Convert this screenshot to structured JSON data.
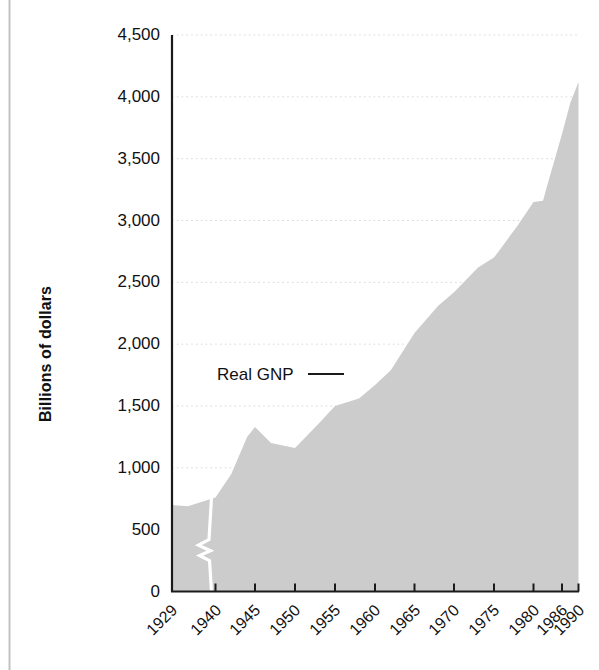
{
  "figure": {
    "background_color": "#ffffff",
    "area_fill_color": "#cccccc",
    "axis_color": "#1a1a1a",
    "gridline_color": "#d8d8d8",
    "break_marker_color": "#ffffff",
    "y_axis_title": "Billions of dollars",
    "series_annotation": "Real GNP"
  },
  "chart_data": {
    "type": "area",
    "title": "",
    "xlabel": "",
    "ylabel": "Billions of dollars",
    "series_name": "Real GNP",
    "grid": true,
    "legend_position": "inline-annotation",
    "ylim": [
      0,
      4500
    ],
    "ytick_labels": [
      "0",
      "500",
      "1,000",
      "1,500",
      "2,000",
      "2,500",
      "3,000",
      "3,500",
      "4,000",
      "4,500"
    ],
    "ytick_values": [
      0,
      500,
      1000,
      1500,
      2000,
      2500,
      3000,
      3500,
      4000,
      4500
    ],
    "xtick_labels": [
      "1929",
      "1940",
      "1945",
      "1950",
      "1955",
      "1960",
      "1965",
      "1970",
      "1975",
      "1980",
      "1986",
      "1990"
    ],
    "xtick_values": [
      1929,
      1940,
      1945,
      1950,
      1955,
      1960,
      1965,
      1970,
      1975,
      1980,
      1986,
      1990
    ],
    "axis_break": {
      "present": true,
      "between": [
        1929,
        1940
      ],
      "note": "white zigzag break in the shaded area between the 1929 and 1940 tick marks"
    },
    "x": [
      1929,
      1933,
      1939,
      1940,
      1942,
      1944,
      1945,
      1947,
      1950,
      1953,
      1955,
      1958,
      1960,
      1962,
      1965,
      1968,
      1970,
      1973,
      1975,
      1978,
      1980,
      1982,
      1983,
      1986,
      1988,
      1990
    ],
    "values": [
      700,
      690,
      750,
      760,
      950,
      1250,
      1330,
      1200,
      1160,
      1360,
      1500,
      1560,
      1670,
      1790,
      2090,
      2310,
      2420,
      2620,
      2700,
      2960,
      3150,
      3160,
      3300,
      3700,
      3950,
      4120
    ],
    "units": "billions of dollars"
  }
}
